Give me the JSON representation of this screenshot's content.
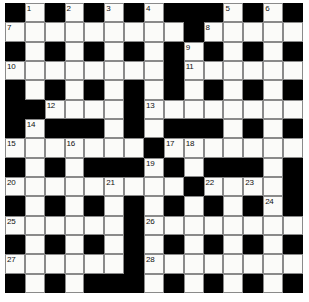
{
  "puzzle": {
    "kind": "crossword-grid",
    "rows": 15,
    "columns": 15,
    "colors": {
      "block": "#000000",
      "open": "#fbfbf9",
      "cell_border": "#8a8a8a",
      "number_text": "#111111",
      "page_background": "#ffffff"
    },
    "legend": {
      "block_char": "#",
      "open_char": "."
    },
    "layout": [
      "#.#.#.#.###.#.#",
      ".........#.....",
      "#.#.#.#.#.#.#.#",
      "........#......",
      "#.#.#.#.#.#.#.#",
      "##....#........",
      "#.###.#.###.#.#",
      ".......#.......",
      "#.#.###.#.###.#",
      ".........#....#",
      "#.#.#.#.#.#.#.#",
      "......#........",
      "#.#.#.#.#.#.#.#",
      "......#........",
      "#.#.###.#.#.#.#"
    ],
    "numbers": [
      {
        "n": "1",
        "row": 0,
        "col": 1
      },
      {
        "n": "2",
        "row": 0,
        "col": 3
      },
      {
        "n": "3",
        "row": 0,
        "col": 5
      },
      {
        "n": "4",
        "row": 0,
        "col": 7
      },
      {
        "n": "5",
        "row": 0,
        "col": 11
      },
      {
        "n": "6",
        "row": 0,
        "col": 13
      },
      {
        "n": "7",
        "row": 1,
        "col": 0
      },
      {
        "n": "8",
        "row": 1,
        "col": 10
      },
      {
        "n": "9",
        "row": 2,
        "col": 9
      },
      {
        "n": "10",
        "row": 3,
        "col": 0
      },
      {
        "n": "11",
        "row": 3,
        "col": 9
      },
      {
        "n": "12",
        "row": 5,
        "col": 2
      },
      {
        "n": "13",
        "row": 5,
        "col": 7
      },
      {
        "n": "14",
        "row": 6,
        "col": 1
      },
      {
        "n": "15",
        "row": 7,
        "col": 0
      },
      {
        "n": "16",
        "row": 7,
        "col": 3
      },
      {
        "n": "17",
        "row": 7,
        "col": 8
      },
      {
        "n": "18",
        "row": 7,
        "col": 9
      },
      {
        "n": "19",
        "row": 8,
        "col": 7
      },
      {
        "n": "20",
        "row": 9,
        "col": 0
      },
      {
        "n": "21",
        "row": 9,
        "col": 5
      },
      {
        "n": "22",
        "row": 9,
        "col": 10
      },
      {
        "n": "23",
        "row": 9,
        "col": 12
      },
      {
        "n": "24",
        "row": 10,
        "col": 13
      },
      {
        "n": "25",
        "row": 11,
        "col": 0
      },
      {
        "n": "26",
        "row": 11,
        "col": 7
      },
      {
        "n": "27",
        "row": 13,
        "col": 0
      },
      {
        "n": "28",
        "row": 13,
        "col": 7
      }
    ]
  }
}
